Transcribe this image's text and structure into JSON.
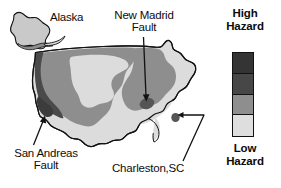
{
  "figure": {
    "background_color": "#ffffff",
    "outline_color": "#121212"
  },
  "map": {
    "regions": [
      {
        "name": "alaska",
        "label": "Alaska",
        "fill": "#c9c9c9"
      },
      {
        "name": "conterminous-us",
        "label": "",
        "fill": "#dcdcdc"
      }
    ],
    "hazard_zones": [
      {
        "name": "west-coast-high-hazard",
        "level": "high",
        "fill": "#4a4a4a"
      },
      {
        "name": "western-interior-moderate-hazard",
        "level": "moderate",
        "fill": "#8e8e8e"
      },
      {
        "name": "interior-low-hazard",
        "level": "low",
        "fill": "#dcdcdc"
      },
      {
        "name": "new-madrid-high-hazard",
        "level": "high",
        "fill": "#555555"
      },
      {
        "name": "charleston-high-hazard",
        "level": "high",
        "fill": "#555555"
      },
      {
        "name": "eastern-moderate-hazard",
        "level": "moderate",
        "fill": "#8e8e8e"
      },
      {
        "name": "gulf-atlantic-coastal-low-hazard",
        "level": "low",
        "fill": "#dcdcdc"
      }
    ]
  },
  "annotations": {
    "alaska": {
      "text": "Alaska"
    },
    "new_madrid": {
      "line1": "New Madrid",
      "line2": "Fault"
    },
    "san_andreas": {
      "line1": "San Andreas",
      "line2": "Fault"
    },
    "charleston": {
      "text": "Charleston,SC"
    }
  },
  "legend": {
    "title_line1": "High",
    "title_line2": "Hazard",
    "footer_line1": "Low",
    "footer_line2": "Hazard",
    "swatches": [
      {
        "name": "hazard-swatch-highest",
        "color": "#343434"
      },
      {
        "name": "hazard-swatch-high",
        "color": "#474747"
      },
      {
        "name": "hazard-swatch-moderate",
        "color": "#8e8e8e"
      },
      {
        "name": "hazard-swatch-low",
        "color": "#dedede"
      }
    ]
  }
}
